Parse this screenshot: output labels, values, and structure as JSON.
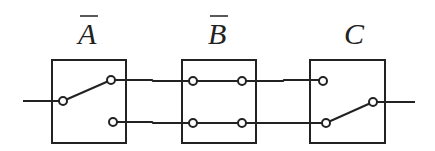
{
  "diagram": {
    "type": "switch-circuit",
    "switches": [
      {
        "id": "A",
        "label": "A",
        "overline": true,
        "kind": "single-pole-double-throw",
        "state": "connected-top"
      },
      {
        "id": "B",
        "label": "B",
        "overline": true,
        "kind": "double-pole-pass-through"
      },
      {
        "id": "C",
        "label": "C",
        "overline": false,
        "kind": "single-pole-double-throw",
        "state": "connected-bottom"
      }
    ],
    "colors": {
      "stroke": "#222222",
      "background": "#ffffff"
    }
  }
}
